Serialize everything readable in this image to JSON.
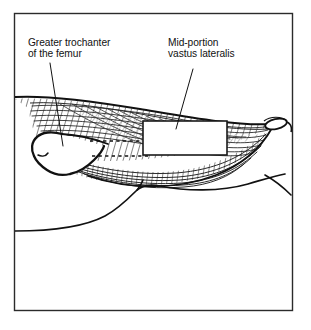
{
  "figure": {
    "frame": {
      "border_color": "#2b2b2b",
      "background_color": "#ffffff"
    },
    "ink_color": "#1a1a1a",
    "hatch_color": "#2a2a2a"
  },
  "labels": [
    {
      "id": "greater-trochanter",
      "line1": "Greater trochanter",
      "line2": "of the femur",
      "x": 28,
      "y": 46
    },
    {
      "id": "mid-portion-vastus-lateralis",
      "line1": "Mid-portion",
      "line2": "vastus lateralis",
      "x": 168,
      "y": 46
    }
  ],
  "leader_lines": [
    {
      "id": "leader-greater-trochanter",
      "from_x": 50,
      "from_y": 63,
      "to_x": 63,
      "to_y": 146
    },
    {
      "id": "leader-vastus-lateralis",
      "from_x": 193,
      "from_y": 69,
      "to_x": 176,
      "to_y": 129
    }
  ],
  "injection_site": {
    "id": "injection-site-rectangle",
    "x": 143,
    "y": 121,
    "width": 84,
    "height": 34,
    "fill": "#ffffff",
    "stroke": "#1a1a1a"
  },
  "anatomy": {
    "greater_trochanter_bone": "rounded bulbous femoral trochanter at left of thigh",
    "patella": "small ellipse at right end of thigh",
    "muscle": "vastus lateralis with fine diagonal hatching",
    "lower_limb_contour": "curved outline of opposite leg below"
  }
}
